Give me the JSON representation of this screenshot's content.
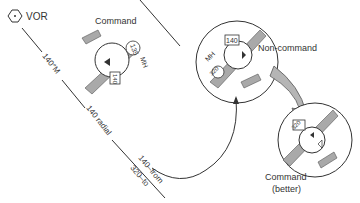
{
  "diagram": {
    "station": {
      "label": "VOR",
      "icon": "vor-hexagon-icon"
    },
    "course_line": {
      "bearing_label": "140°M",
      "radial_label": "140 radial",
      "from_label": "140–from",
      "to_label": "320–to"
    },
    "aircraft": [
      {
        "id": "command",
        "label": "Command",
        "heading_label": "MH",
        "heading_value": "135",
        "obs_value": "140"
      },
      {
        "id": "non-command",
        "label": "Non-command",
        "heading_label": "MH",
        "heading_value": "320",
        "obs_value": "140"
      },
      {
        "id": "command-better",
        "label": "Command",
        "sublabel": "(better)",
        "obs_value": "320"
      }
    ],
    "colors": {
      "aircraft_fill": "#a9a9a9",
      "line": "#333333",
      "arrow_fill": "#b5b5b5"
    }
  }
}
